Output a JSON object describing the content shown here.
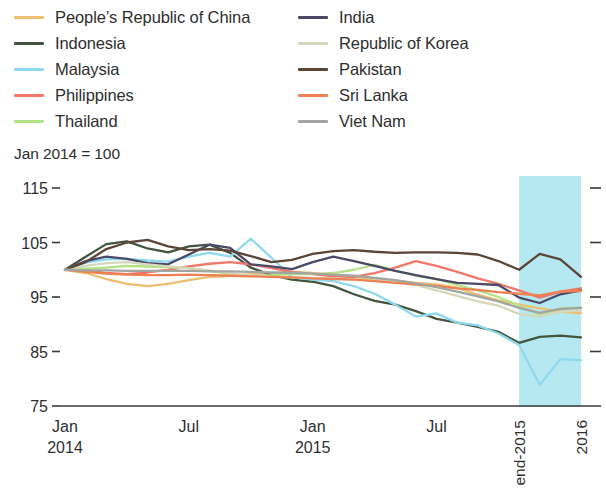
{
  "legend": {
    "columns": [
      {
        "items": [
          {
            "label": "People’s Republic of China",
            "color": "#edbe6e",
            "name": "prc"
          },
          {
            "label": "Indonesia",
            "color": "#44553f",
            "name": "indonesia"
          },
          {
            "label": "Malaysia",
            "color": "#8fd9ee",
            "name": "malaysia"
          },
          {
            "label": "Philippines",
            "color": "#f2776a",
            "name": "philippines"
          },
          {
            "label": "Thailand",
            "color": "#b4e385",
            "name": "thailand"
          }
        ]
      },
      {
        "items": [
          {
            "label": "India",
            "color": "#4a4a68",
            "name": "india"
          },
          {
            "label": "Republic of Korea",
            "color": "#d6d7bb",
            "name": "republic-of-korea"
          },
          {
            "label": "Pakistan",
            "color": "#5a4537",
            "name": "pakistan"
          },
          {
            "label": "Sri Lanka",
            "color": "#ef8053",
            "name": "sri-lanka"
          },
          {
            "label": "Viet Nam",
            "color": "#a2a6a1",
            "name": "viet-nam"
          }
        ]
      }
    ]
  },
  "index_note": "Jan 2014 = 100",
  "chart_data": {
    "type": "line",
    "title": "",
    "subtitle": "",
    "xlabel": "",
    "ylabel": "",
    "note": "Jan 2014 = 100",
    "ylim": [
      75,
      115
    ],
    "yticks": [
      75,
      85,
      95,
      105,
      115
    ],
    "ytick_labels": [
      "75",
      "85",
      "95",
      "105",
      "115"
    ],
    "grid": false,
    "legend_position": "top",
    "xlim": [
      0,
      25
    ],
    "x": [
      0,
      1,
      2,
      3,
      4,
      5,
      6,
      7,
      8,
      9,
      10,
      11,
      12,
      13,
      14,
      15,
      16,
      17,
      18,
      19,
      20,
      21,
      22,
      23,
      24,
      25
    ],
    "xticks": [
      {
        "value": 0,
        "label": "Jan",
        "label2": "2014"
      },
      {
        "value": 6,
        "label": "Jul",
        "label2": ""
      },
      {
        "value": 12,
        "label": "Jan",
        "label2": "2015"
      },
      {
        "value": 18,
        "label": "Jul",
        "label2": ""
      },
      {
        "value": 22,
        "label": "end-2015",
        "label2": "",
        "rotated": true
      },
      {
        "value": 25,
        "label": "2016",
        "label2": "",
        "rotated": true
      }
    ],
    "shaded_region": {
      "from": 22,
      "to": 25,
      "color": "#b5e8f0",
      "label": "end-2015 to 2016"
    },
    "series": [
      {
        "name": "People’s Republic of China",
        "color": "#edbe6e",
        "values": [
          100,
          99.4,
          98.3,
          97.4,
          97.0,
          97.4,
          98.1,
          98.7,
          98.9,
          99.2,
          99.4,
          99.6,
          99.4,
          99.0,
          98.6,
          98.3,
          98.0,
          97.6,
          97.3,
          96.7,
          95.4,
          94.4,
          93.6,
          92.9,
          92.3,
          92.0
        ]
      },
      {
        "name": "Indonesia",
        "color": "#44553f",
        "values": [
          100,
          102.4,
          104.7,
          105.2,
          103.9,
          103.2,
          104.3,
          104.6,
          103.1,
          100.4,
          99.0,
          98.2,
          97.8,
          97.0,
          95.5,
          94.3,
          93.6,
          92.4,
          91.0,
          90.3,
          89.5,
          88.6,
          86.6,
          87.7,
          87.9,
          87.6
        ]
      },
      {
        "name": "Malaysia",
        "color": "#8fd9ee",
        "values": [
          100,
          101.3,
          101.9,
          102.0,
          101.7,
          101.5,
          102.4,
          103.1,
          102.4,
          105.7,
          102.2,
          98.6,
          98.2,
          97.9,
          97.0,
          95.6,
          93.6,
          91.4,
          92.0,
          90.3,
          89.8,
          88.3,
          86.2,
          78.9,
          83.6,
          83.4
        ]
      },
      {
        "name": "Philippines",
        "color": "#f2776a",
        "values": [
          100,
          100.0,
          99.4,
          99.2,
          99.5,
          100.0,
          100.6,
          101.1,
          101.4,
          101.0,
          100.3,
          99.6,
          99.2,
          98.8,
          98.7,
          99.4,
          100.4,
          101.6,
          100.7,
          99.6,
          98.4,
          97.4,
          96.2,
          94.9,
          96.0,
          96.6
        ]
      },
      {
        "name": "Thailand",
        "color": "#b4e385",
        "values": [
          100,
          100.2,
          100.4,
          100.7,
          100.6,
          100.5,
          100.3,
          99.8,
          99.2,
          98.9,
          99.0,
          99.2,
          99.2,
          99.4,
          100.0,
          100.9,
          99.8,
          98.9,
          98.3,
          97.2,
          96.2,
          95.0,
          93.4,
          91.8,
          92.9,
          93.1
        ]
      },
      {
        "name": "India",
        "color": "#4a4a68",
        "values": [
          100,
          101.6,
          102.4,
          102.0,
          101.2,
          101.0,
          102.8,
          104.6,
          104.0,
          101.0,
          100.6,
          100.1,
          101.4,
          102.4,
          101.6,
          100.7,
          99.8,
          99.0,
          98.3,
          97.6,
          97.4,
          97.2,
          94.9,
          93.9,
          95.5,
          96.2
        ]
      },
      {
        "name": "Republic of Korea",
        "color": "#d6d7bb",
        "values": [
          100,
          100.7,
          101.2,
          101.4,
          101.0,
          100.6,
          100.3,
          99.9,
          99.4,
          99.0,
          98.7,
          98.6,
          98.5,
          98.4,
          98.2,
          98.0,
          97.8,
          97.2,
          96.2,
          95.2,
          94.2,
          93.4,
          91.9,
          91.4,
          92.3,
          92.5
        ]
      },
      {
        "name": "Pakistan",
        "color": "#5a4537",
        "values": [
          100,
          101.4,
          103.8,
          105.0,
          105.5,
          104.3,
          103.6,
          103.8,
          103.5,
          102.5,
          101.4,
          101.8,
          102.9,
          103.4,
          103.6,
          103.3,
          103.1,
          103.2,
          103.2,
          103.1,
          102.8,
          101.6,
          100.0,
          102.9,
          101.9,
          98.7
        ]
      },
      {
        "name": "Sri Lanka",
        "color": "#ef8053",
        "values": [
          100,
          99.6,
          99.3,
          99.1,
          99.0,
          99.0,
          99.1,
          99.0,
          98.9,
          98.8,
          98.7,
          98.6,
          98.4,
          98.3,
          98.2,
          97.9,
          97.6,
          97.3,
          97.0,
          96.6,
          96.3,
          95.9,
          95.6,
          95.3,
          96.0,
          96.1
        ]
      },
      {
        "name": "Viet Nam",
        "color": "#a2a6a1",
        "values": [
          100,
          99.9,
          99.9,
          99.8,
          99.8,
          99.8,
          99.8,
          99.7,
          99.7,
          99.6,
          99.5,
          99.4,
          99.3,
          99.1,
          98.9,
          98.5,
          98.1,
          97.5,
          96.8,
          96.0,
          95.1,
          94.2,
          93.0,
          92.1,
          92.8,
          93.0
        ]
      }
    ]
  }
}
